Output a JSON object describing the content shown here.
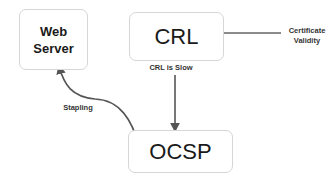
{
  "nodes": {
    "web_server": {
      "line1": "Web",
      "line2": "Server"
    },
    "crl": {
      "label": "CRL"
    },
    "ocsp": {
      "label": "OCSP"
    }
  },
  "edges": {
    "certificate_validity": {
      "line1": "Certificate",
      "line2": "Validity"
    },
    "crl_to_ocsp": {
      "label": "CRL is Slow"
    },
    "stapling": {
      "label": "Stapling"
    }
  },
  "colors": {
    "arrow": "#555555",
    "box_border": "#d6d6d6"
  }
}
